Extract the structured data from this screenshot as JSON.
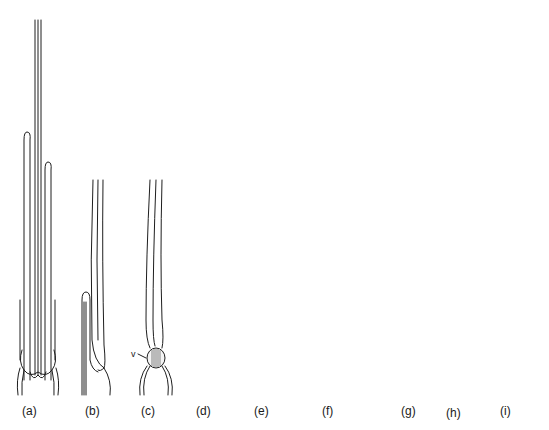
{
  "figure": {
    "type": "scientific line illustration",
    "panels": [
      {
        "id": "a",
        "label": "(a)",
        "description": "group of elongated hairs with rounded tips emerging from base"
      },
      {
        "id": "b",
        "label": "(b)",
        "description": "hair bundle with folded hair at lower left"
      },
      {
        "id": "c",
        "label": "(c)",
        "description": "hair bundle with hatched body at base",
        "annotation": "v"
      },
      {
        "id": "d",
        "label": "(d)",
        "description": "hair bundle with folded hair and hatched oval body"
      },
      {
        "id": "e",
        "label": "(e)",
        "description": "hair bundle with hatched body and adjacent stem"
      },
      {
        "id": "f",
        "label": "(f)",
        "description": "stippled branched body with crossing hairs, dashed segments"
      },
      {
        "id": "g",
        "label": "(g)",
        "description": "hair bundle with stippled curved body at base"
      },
      {
        "id": "h",
        "label": "(h)",
        "description": "hair bundle with stippled elongated body hanging down"
      },
      {
        "id": "i",
        "label": "(i)",
        "description": "folded hair loop with stippled elongated body"
      }
    ],
    "annotations": {
      "v_label": "v"
    }
  }
}
